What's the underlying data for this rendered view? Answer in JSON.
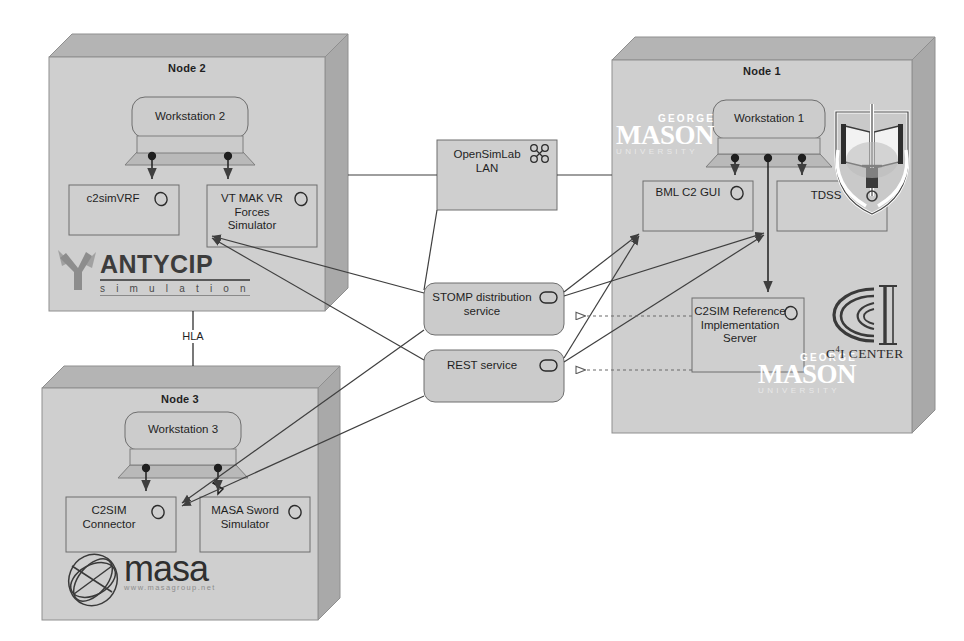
{
  "diagram": {
    "colors": {
      "node_face": "#cfcfcf",
      "node_top": "#b4b4b4",
      "node_side": "#a9a9a9",
      "component_fill": "#cfcfcf",
      "service_fill": "#cbcbcb",
      "lan_fill": "#cfcfcf",
      "stroke": "#5b5b5b",
      "link": "#3f3f3f",
      "dashed_link": "#6b6b6b"
    }
  },
  "nodes": [
    {
      "id": "node2",
      "title": "Node 2",
      "workstation": {
        "label": "Workstation 2"
      },
      "components": [
        {
          "label": "c2simVRF",
          "icon": "component-gear-icon"
        },
        {
          "label": "VT MAK VR Forces Simulator",
          "icon": "component-gear-icon"
        }
      ],
      "logo": {
        "name": "antycip-logo",
        "word": "ANTYCIP",
        "sub": "s i m u l a t i o n"
      }
    },
    {
      "id": "node3",
      "title": "Node 3",
      "workstation": {
        "label": "Workstation 3"
      },
      "components": [
        {
          "label": "C2SIM Connector",
          "icon": "component-gear-icon"
        },
        {
          "label": "MASA Sword Simulator",
          "icon": "component-gear-icon"
        }
      ],
      "logo": {
        "name": "masa-logo",
        "word": "masa",
        "sub": "www.masagroup.net"
      }
    },
    {
      "id": "node1",
      "title": "Node 1",
      "workstation": {
        "label": "Workstation 1"
      },
      "components": [
        {
          "label": "BML C2 GUI",
          "icon": "component-gear-icon"
        },
        {
          "label": "TDSS",
          "icon": "component-gear-icon"
        },
        {
          "label": "C2SIM Reference Implementation Server",
          "icon": "component-gear-icon"
        }
      ],
      "logos": [
        {
          "name": "gmu-logo-top",
          "line1": "GEORGE",
          "line2": "MASON",
          "line3": "UNIVERSITY"
        },
        {
          "name": "gmu-logo-bottom",
          "line1": "GEORGE",
          "line2": "MASON",
          "line3": "UNIVERSITY"
        },
        {
          "name": "c4i-center-logo",
          "text": "C",
          "sup": "4",
          "text2": "I CENTER"
        },
        {
          "name": "military-crest-icon",
          "label": "shield crest with book and sword"
        }
      ]
    }
  ],
  "network": {
    "lan": {
      "label_line1": "OpenSimLab",
      "label_line2": "LAN",
      "icon": "network-nodes-icon"
    },
    "services": [
      {
        "id": "stomp",
        "label_line1": "STOMP distribution",
        "label_line2": "service",
        "icon": "interface-oval-icon"
      },
      {
        "id": "rest",
        "label_line1": "REST service",
        "label_line2": "",
        "icon": "interface-oval-icon"
      }
    ],
    "connection_labels": [
      {
        "id": "hla",
        "label": "HLA"
      }
    ]
  }
}
